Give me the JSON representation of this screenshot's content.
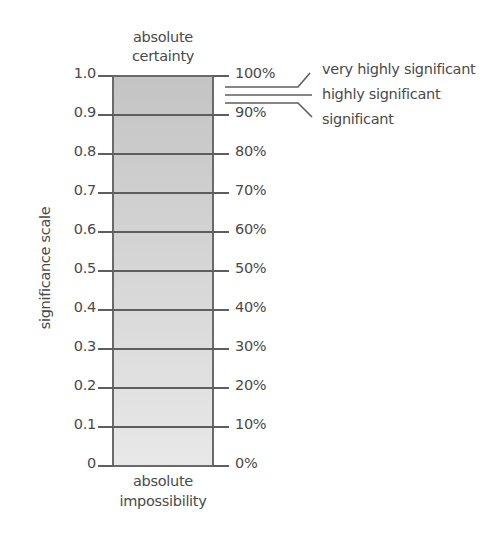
{
  "chart_data": {
    "type": "scale",
    "title": "",
    "ylabel": "significance scale",
    "top_label": "absolute certainty",
    "top_label_lines": [
      "absolute",
      "certainty"
    ],
    "bottom_label": "absolute impossibility",
    "bottom_label_lines": [
      "absolute",
      "impossibility"
    ],
    "left_ticks": [
      "1.0",
      "0.9",
      "0.8",
      "0.7",
      "0.6",
      "0.5",
      "0.4",
      "0.3",
      "0.2",
      "0.1",
      "0"
    ],
    "right_ticks": [
      "100%",
      "90%",
      "80%",
      "70%",
      "60%",
      "50%",
      "40%",
      "30%",
      "20%",
      "10%",
      "0%"
    ],
    "values": [
      1.0,
      0.9,
      0.8,
      0.7,
      0.6,
      0.5,
      0.4,
      0.3,
      0.2,
      0.1,
      0.0
    ],
    "ylim": [
      0,
      1
    ],
    "annotations": [
      {
        "label": "very highly significant",
        "level": 0.99
      },
      {
        "label": "highly significant",
        "level": 0.98
      },
      {
        "label": "significant",
        "level": 0.95
      }
    ]
  },
  "colors": {
    "bar_top": "#c4c4c4",
    "bar_bottom": "#e8e8e8",
    "lines": "#5e5e5e",
    "text": "#4a4a4a"
  }
}
